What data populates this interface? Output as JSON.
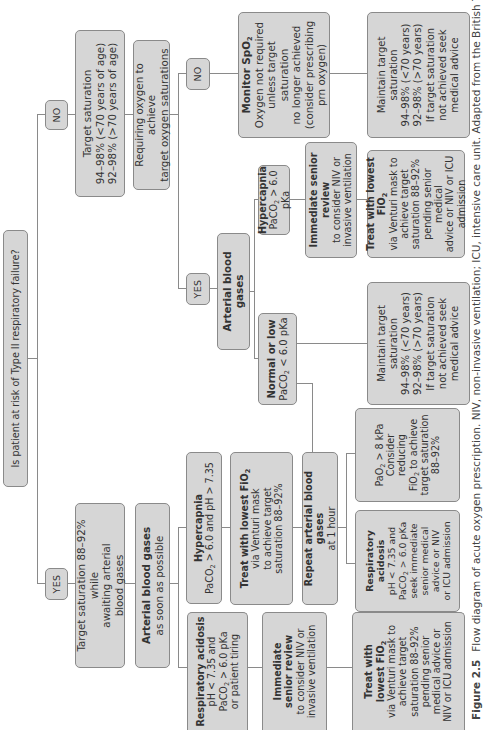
{
  "diagram": {
    "question": "Is patient at risk of Type II respiratory failure?",
    "no_branch": {
      "label": "NO",
      "target_saturation": {
        "title": "Target saturation",
        "line1": "94–98% (<70 years of age)",
        "line2": "92–98% (>70 years of age)"
      },
      "requiring_oxygen": {
        "line1": "Requiring oxygen to achieve",
        "line2": "target oxygen saturations"
      },
      "no": {
        "label": "NO",
        "monitor": {
          "title": "Monitor SpO",
          "title_sub": "2",
          "lines": [
            "Oxygen not required",
            "unless target saturation",
            "no longer achieved",
            "(consider prescribing",
            "prn oxygen)"
          ]
        },
        "maintain": {
          "lines": [
            "Maintain target",
            "saturation",
            "94–98% (<70 years)",
            "92–98% (>70 years)",
            "If target saturation",
            "not achieved seek",
            "medical advice"
          ]
        }
      },
      "yes": {
        "label": "YES",
        "abg": "Arterial blood gases",
        "hypercapnia": {
          "title": "Hypercapnia",
          "detail_pre": "PaCO",
          "detail_sub": "2",
          "detail_post": " > 6.0 pKa"
        },
        "immediate_review": {
          "title": "Immediate senior review",
          "lines": [
            "to consider NIV or",
            "invasive ventilation"
          ]
        },
        "treat": {
          "title_pre": "Treat with lowest FiO",
          "title_sub": "2",
          "lines": [
            "via Venturi mask to",
            "achieve target",
            "saturation 88–92%",
            "pending senior medical",
            "advice or NIV or ICU",
            "admission"
          ]
        },
        "normal_low": {
          "title": "Normal or low",
          "detail_pre": "PaCO",
          "detail_sub": "2",
          "detail_post": " < 6.0 pKa"
        },
        "maintain": {
          "lines": [
            "Maintain target",
            "saturation",
            "94–98% (<70 years)",
            "92–98% (>70 years)",
            "If target saturation",
            "not achieved seek",
            "medical advice"
          ]
        }
      }
    },
    "yes_branch": {
      "label": "YES",
      "target": {
        "lines": [
          "Target saturation 88–92% while",
          "awaiting arterial",
          "blood gases"
        ]
      },
      "abg": {
        "title": "Arterial blood gases",
        "subtitle": "as soon as possible"
      },
      "hypercapnia": {
        "title": "Hypercapnia",
        "detail_pre": "PaCO",
        "detail_sub": "2",
        "detail_post": " > 6.0 and pH > 7.35"
      },
      "treat_venturi": {
        "title_pre": "Treat with lowest FiO",
        "title_sub": "2",
        "lines": [
          "via Venturi mask",
          "to achieve target",
          "saturation 88–92%"
        ]
      },
      "repeat_abg": {
        "title": "Repeat arterial blood gases",
        "subtitle": "at 1 hour"
      },
      "pao2": {
        "line1_pre": "PaO",
        "line1_sub": "2",
        "line1_post": " > 8 kPa",
        "line2": "Consider",
        "line3": "reducing",
        "line4_pre": "FiO",
        "line4_sub": "2",
        "line4_post": " to achieve",
        "line5": "target saturation",
        "line6": "88–92%"
      },
      "resp_acidosis_repeat": {
        "title1": "Respiratory",
        "title2": "acidosis",
        "line1": "pH < 7.35 and",
        "line2_pre": "PaCO",
        "line2_sub": "2",
        "line2_post": " > 6.0 pKa",
        "line3": "seek immediate",
        "line4": "senior medical",
        "line5": "advice or NIV",
        "line6": "or ICU admission"
      },
      "resp_acidosis": {
        "title": "Respiratory acidosis",
        "line1": "pH < 7.35 and",
        "line2_pre": "PaCO",
        "line2_sub": "2",
        "line2_post": " > 6.0 pKa",
        "line3": "or patient tiring"
      },
      "immediate_review": {
        "title1": "Immediate",
        "title2": "senior review",
        "line1": "to consider NIV or",
        "line2": "invasive ventilation"
      },
      "treat_lowest": {
        "title1": "Treat with",
        "title2_pre": "lowest FiO",
        "title2_sub": "2",
        "lines": [
          "via Venturi mask to",
          "achieve target",
          "saturation 88–92%",
          "pending senior",
          "medical advice or",
          "NIV or ICU admission"
        ]
      }
    }
  },
  "caption": {
    "figure": "Figure 2.5",
    "text": "Flow diagram of acute oxygen prescription. NIV, non-invasive ventilation; ICU, intensive care unit. Adapted from the British Thoracic"
  },
  "colors": {
    "box_fill": "#d6d6d6",
    "box_border": "#8a8a8a",
    "line": "#8a8a8a",
    "text": "#333333"
  }
}
